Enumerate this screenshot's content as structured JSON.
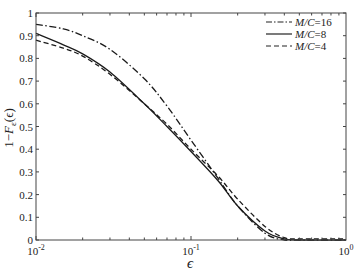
{
  "chart_data": {
    "type": "line",
    "title": "",
    "xlabel": "ϵ",
    "ylabel": "1−F_ε(ϵ)",
    "xscale": "log",
    "xlim": [
      0.01,
      1
    ],
    "ylim": [
      0,
      1
    ],
    "grid": false,
    "legend_position": "upper right",
    "x_ticks": [
      {
        "value": 0.01,
        "base": "10",
        "exp": "-2"
      },
      {
        "value": 0.1,
        "base": "10",
        "exp": "-1"
      },
      {
        "value": 1,
        "base": "10",
        "exp": "0"
      }
    ],
    "y_ticks": [
      "0",
      "0.1",
      "0.2",
      "0.3",
      "0.4",
      "0.5",
      "0.6",
      "0.7",
      "0.8",
      "0.9",
      "1"
    ],
    "x": [
      0.01,
      0.015,
      0.02,
      0.03,
      0.05,
      0.07,
      0.1,
      0.15,
      0.2,
      0.3,
      0.4,
      0.5,
      1.0
    ],
    "series": [
      {
        "name": "M/C=16",
        "style": "dashdot",
        "values": [
          0.95,
          0.93,
          0.9,
          0.84,
          0.71,
          0.59,
          0.44,
          0.27,
          0.15,
          0.03,
          0.0,
          0.0,
          0.0
        ]
      },
      {
        "name": "M/C=8",
        "style": "solid",
        "values": [
          0.91,
          0.86,
          0.82,
          0.74,
          0.6,
          0.5,
          0.39,
          0.26,
          0.15,
          0.04,
          0.005,
          0.0,
          0.0
        ]
      },
      {
        "name": "M/C=4",
        "style": "dashed",
        "values": [
          0.88,
          0.845,
          0.81,
          0.73,
          0.6,
          0.51,
          0.4,
          0.28,
          0.18,
          0.06,
          0.01,
          0.005,
          0.005
        ]
      }
    ]
  },
  "legend": [
    {
      "label_italic": "M/C",
      "label_rest": "=16"
    },
    {
      "label_italic": "M/C",
      "label_rest": "=8"
    },
    {
      "label_italic": "M/C",
      "label_rest": "=4"
    }
  ],
  "axis": {
    "xlabel": "ϵ",
    "ylabel_pre": "1−",
    "ylabel_F": "F",
    "ylabel_sub": "ε",
    "ylabel_post": "(ϵ)"
  }
}
